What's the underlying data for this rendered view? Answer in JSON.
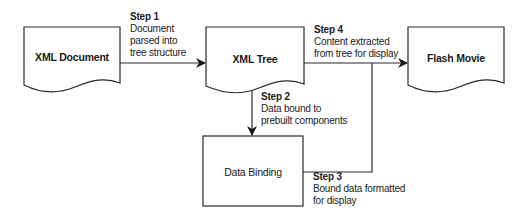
{
  "nodes": {
    "xml_document": {
      "label": "XML Document"
    },
    "xml_tree": {
      "label": "XML Tree"
    },
    "flash_movie": {
      "label": "Flash Movie"
    },
    "data_binding": {
      "label": "Data Binding"
    }
  },
  "steps": [
    {
      "title": "Step 1",
      "lines": [
        "Document",
        "parsed into",
        "tree structure"
      ]
    },
    {
      "title": "Step 2",
      "lines": [
        "Data bound to",
        "prebuilt components"
      ]
    },
    {
      "title": "Step 3",
      "lines": [
        "Bound data formatted",
        "for display"
      ]
    },
    {
      "title": "Step 4",
      "lines": [
        "Content extracted",
        "from tree for display"
      ]
    }
  ],
  "colors": {
    "stroke": "#2a2a2a",
    "background": "#ffffff",
    "text": "#222222"
  }
}
